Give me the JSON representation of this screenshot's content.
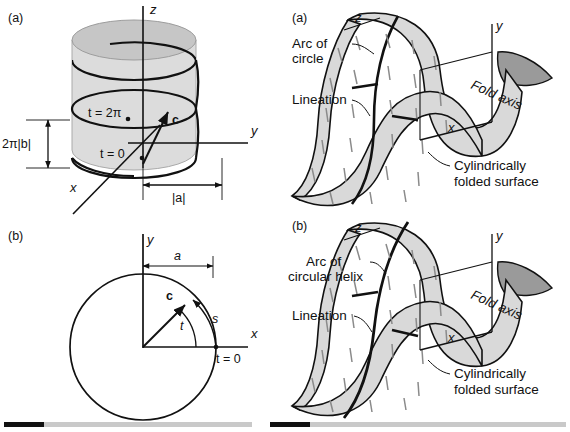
{
  "figure": {
    "colors": {
      "ink": "#111111",
      "cylinder_body": "#dcdcdc",
      "cylinder_top": "#c4c4c4",
      "surface_fill": "#d9d9d9",
      "surface_shadow": "#9a9a9a",
      "lineation_stroke": "#7a7a7a",
      "divider_dark": "#111111",
      "divider_light": "#c9c9c9"
    }
  },
  "panels": {
    "left_a": {
      "letter": "(a)",
      "axes": {
        "x": "x",
        "y": "y",
        "z": "z"
      },
      "labels": {
        "t_two_pi": "t = 2π",
        "t_zero": "t = 0",
        "vector_c": "c",
        "pitch": "2π|b|",
        "radius": "|a|"
      }
    },
    "left_b": {
      "letter": "(b)",
      "axes": {
        "x": "x",
        "y": "y"
      },
      "labels": {
        "radius": "a",
        "vector_c": "c",
        "angle_t": "t",
        "arc_s": "s",
        "t_zero": "t = 0"
      }
    },
    "right_a": {
      "letter": "(a)",
      "axes": {
        "x": "x",
        "y": "y",
        "z": "z"
      },
      "labels": {
        "arc": "Arc of",
        "arc_second_line": "circle",
        "lineation": "Lineation",
        "fold_axis": "Fold axis",
        "surface": "Cylindrically",
        "surface_second_line": "folded surface"
      }
    },
    "right_b": {
      "letter": "(b)",
      "axes": {
        "x": "x",
        "y": "y",
        "z": "z"
      },
      "labels": {
        "arc": "Arc of",
        "arc_second_line": "circular helix",
        "lineation": "Lineation",
        "fold_axis": "Fold axis",
        "surface": "Cylindrically",
        "surface_second_line": "folded surface"
      }
    }
  }
}
